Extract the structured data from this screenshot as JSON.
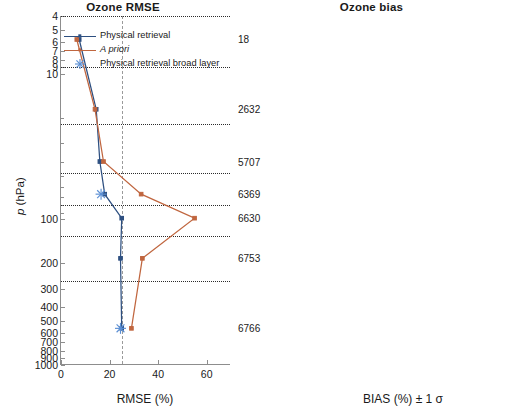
{
  "figure": {
    "ylabel": "p (hPa)",
    "ytick_labels": [
      "4",
      "5",
      "6",
      "7",
      "8",
      "9",
      "10",
      "100",
      "200",
      "300",
      "400",
      "500",
      "600",
      "700",
      "800",
      "900",
      "1000"
    ],
    "y_range_hpa": [
      4,
      1000
    ],
    "right_labels": [
      "18",
      "2632",
      "5707",
      "6369",
      "6630",
      "6753",
      "6766"
    ],
    "right_label_pressures": [
      5.8,
      17.5,
      40,
      67,
      98,
      185,
      560
    ],
    "layer_boundaries_hpa": [
      4,
      9.0,
      22,
      48,
      80,
      130,
      263
    ]
  },
  "legend": {
    "items": [
      {
        "label": "Physical retrieval",
        "style": "line-square",
        "color": "#2d4f80",
        "italic": false
      },
      {
        "label": "A priori",
        "style": "line-square",
        "color": "#c0663f",
        "italic": true
      },
      {
        "label": "Physical retrieval broad layer",
        "style": "star",
        "color": "#5b8fd4",
        "italic": false
      }
    ]
  },
  "chart_data": [
    {
      "type": "line",
      "title": "Ozone RMSE",
      "xlabel": "RMSE (%)",
      "ylabel": "p (hPa)",
      "xlim": [
        0,
        70
      ],
      "ylim": [
        4,
        1000
      ],
      "yscale": "log",
      "xticks": [
        0,
        20,
        40,
        60
      ],
      "grid": "horizontal-dotted",
      "vertical_reference": 25,
      "series": [
        {
          "name": "Physical retrieval",
          "color": "#2d4f80",
          "points": [
            {
              "x": 7.5,
              "p": 5.8
            },
            {
              "x": 14.5,
              "p": 17.5
            },
            {
              "x": 16.0,
              "p": 40
            },
            {
              "x": 18.0,
              "p": 67
            },
            {
              "x": 25.0,
              "p": 98
            },
            {
              "x": 24.5,
              "p": 185
            },
            {
              "x": 25.0,
              "p": 560
            }
          ]
        },
        {
          "name": "A priori",
          "color": "#c0663f",
          "points": [
            {
              "x": 6.5,
              "p": 5.8
            },
            {
              "x": 14.0,
              "p": 17.5
            },
            {
              "x": 17.5,
              "p": 40
            },
            {
              "x": 33.0,
              "p": 67
            },
            {
              "x": 55.0,
              "p": 98
            },
            {
              "x": 33.5,
              "p": 185
            },
            {
              "x": 29.0,
              "p": 560
            }
          ]
        },
        {
          "name": "Physical retrieval broad layer",
          "color": "#5b8fd4",
          "marker": "star",
          "points": [
            {
              "x": 16.5,
              "p": 67
            },
            {
              "x": 24.5,
              "p": 560
            }
          ]
        }
      ]
    },
    {
      "type": "line",
      "title": "Ozone bias",
      "xlabel": "BIAS (%) ± 1 σ",
      "ylabel": "p (hPa)",
      "xlim": [
        -70,
        70
      ],
      "ylim": [
        4,
        1000
      ],
      "yscale": "log",
      "xticks": [
        -50,
        0,
        50
      ],
      "grid": "horizontal-dotted",
      "vertical_references": [
        -10,
        10
      ],
      "zero_line": 0,
      "series": [
        {
          "name": "Physical retrieval",
          "color": "#2d4f80",
          "points": [
            {
              "x": 7.5,
              "p": 5.8,
              "err": 2.0
            },
            {
              "x": 4.5,
              "p": 17.5,
              "err": 13.0
            },
            {
              "x": 0.5,
              "p": 40,
              "err": 11.0
            },
            {
              "x": 2.5,
              "p": 67,
              "err": 19.0
            },
            {
              "x": 8.0,
              "p": 98,
              "err": 9.0
            },
            {
              "x": 7.5,
              "p": 185,
              "err": 11.0
            },
            {
              "x": -9.0,
              "p": 560,
              "err": 21.0
            }
          ]
        },
        {
          "name": "A priori",
          "color": "#c0663f",
          "points": [
            {
              "x": -0.5,
              "p": 5.8,
              "err": 1.0
            },
            {
              "x": 4.0,
              "p": 17.5,
              "err": 13.0
            },
            {
              "x": 0.0,
              "p": 40,
              "err": 18.0
            },
            {
              "x": -0.5,
              "p": 67,
              "err": 32.0
            },
            {
              "x": 1.5,
              "p": 98,
              "err": 54.0
            },
            {
              "x": 13.0,
              "p": 185,
              "err": 31.0
            },
            {
              "x": -9.5,
              "p": 560,
              "err": 25.0
            }
          ]
        },
        {
          "name": "Physical retrieval broad layer",
          "color": "#2d6fc0",
          "marker": "star",
          "points": [
            {
              "x": 2.0,
              "p": 80,
              "err": 18.0
            },
            {
              "x": -8.5,
              "p": 560,
              "err": 20.0
            }
          ]
        }
      ]
    }
  ]
}
